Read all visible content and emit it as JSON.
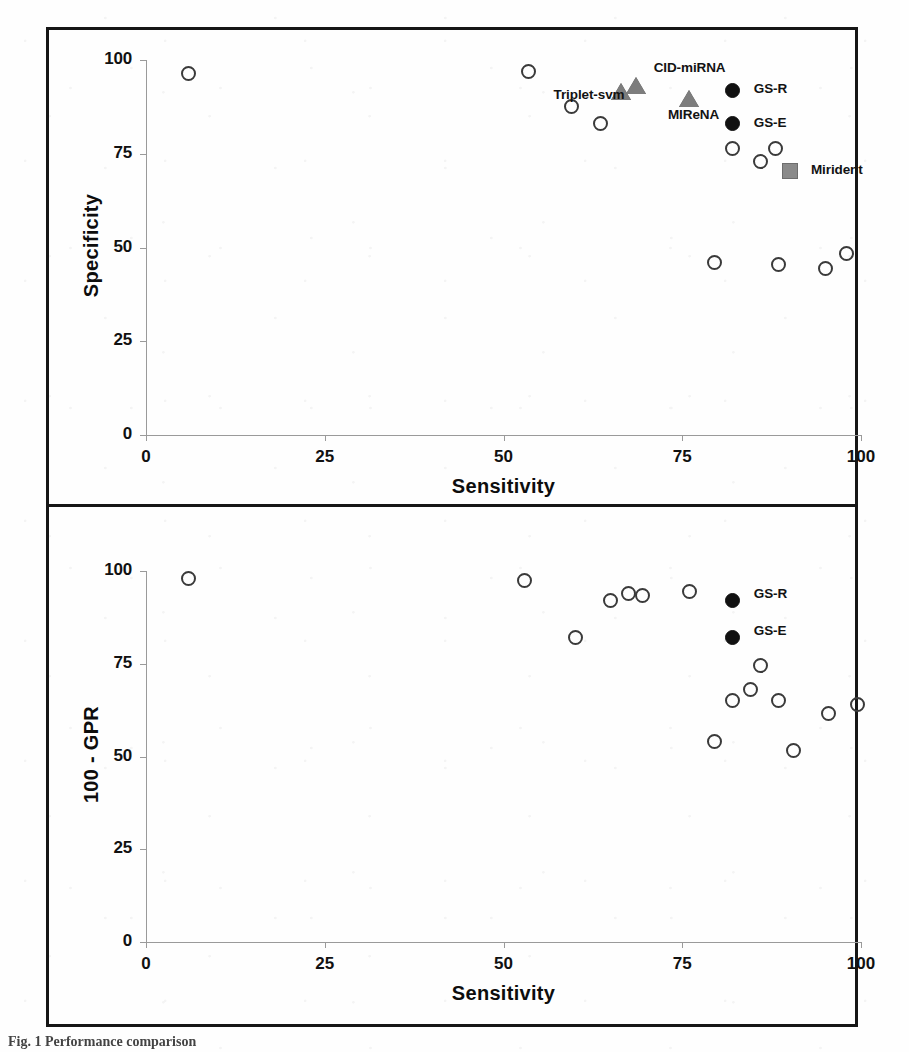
{
  "figure": {
    "caption": "Fig. 1 Performance comparison"
  },
  "chart_data": [
    {
      "type": "scatter",
      "panel": "top",
      "title": "",
      "xlabel": "Sensitivity",
      "ylabel": "Specificity",
      "xlim": [
        0,
        100
      ],
      "ylim": [
        0,
        100
      ],
      "xticks": [
        0,
        25,
        50,
        75,
        100
      ],
      "yticks": [
        0,
        25,
        50,
        75,
        100
      ],
      "grid": false,
      "legend": "none",
      "series": [
        {
          "name": "other-tools",
          "marker": "open-circle",
          "points": [
            {
              "x": 6.0,
              "y": 96.5
            },
            {
              "x": 53.5,
              "y": 97.0
            },
            {
              "x": 59.5,
              "y": 87.5
            },
            {
              "x": 63.5,
              "y": 83.0
            },
            {
              "x": 82.0,
              "y": 76.5
            },
            {
              "x": 88.0,
              "y": 76.5
            },
            {
              "x": 86.0,
              "y": 73.0
            },
            {
              "x": 79.5,
              "y": 46.0
            },
            {
              "x": 88.5,
              "y": 45.5
            },
            {
              "x": 95.0,
              "y": 44.5
            },
            {
              "x": 98.0,
              "y": 48.5
            }
          ]
        },
        {
          "name": "triangle-tools",
          "marker": "triangle",
          "points": [
            {
              "x": 66.5,
              "y": 91.5
            },
            {
              "x": 68.5,
              "y": 93.0
            },
            {
              "x": 76.0,
              "y": 89.5
            }
          ]
        },
        {
          "name": "gene-signature",
          "marker": "filled-circle",
          "points": [
            {
              "x": 82.0,
              "y": 92.0
            },
            {
              "x": 82.0,
              "y": 83.0
            }
          ]
        },
        {
          "name": "mirident",
          "marker": "square",
          "points": [
            {
              "x": 90.0,
              "y": 70.5
            }
          ]
        }
      ],
      "annotations": [
        {
          "text": "Triplet-svm",
          "x": 57.0,
          "y": 90.5
        },
        {
          "text": "CID-miRNA",
          "x": 71.0,
          "y": 97.5
        },
        {
          "text": "MIReNA",
          "x": 73.0,
          "y": 85.0
        },
        {
          "text": "GS-R",
          "x": 85.0,
          "y": 92.0
        },
        {
          "text": "GS-E",
          "x": 85.0,
          "y": 83.0
        },
        {
          "text": "Mirident",
          "x": 93.0,
          "y": 70.5
        }
      ]
    },
    {
      "type": "scatter",
      "panel": "bottom",
      "title": "",
      "xlabel": "Sensitivity",
      "ylabel": "100 - GPR",
      "xlim": [
        0,
        100
      ],
      "ylim": [
        0,
        100
      ],
      "xticks": [
        0,
        25,
        50,
        75,
        100
      ],
      "yticks": [
        0,
        25,
        50,
        75,
        100
      ],
      "grid": false,
      "legend": "none",
      "series": [
        {
          "name": "other-tools",
          "marker": "open-circle",
          "points": [
            {
              "x": 6.0,
              "y": 98.0
            },
            {
              "x": 53.0,
              "y": 97.5
            },
            {
              "x": 65.0,
              "y": 92.0
            },
            {
              "x": 67.5,
              "y": 94.0
            },
            {
              "x": 69.5,
              "y": 93.5
            },
            {
              "x": 60.0,
              "y": 82.0
            },
            {
              "x": 76.0,
              "y": 94.5
            },
            {
              "x": 86.0,
              "y": 74.5
            },
            {
              "x": 84.5,
              "y": 68.0
            },
            {
              "x": 82.0,
              "y": 65.0
            },
            {
              "x": 88.5,
              "y": 65.0
            },
            {
              "x": 79.5,
              "y": 54.0
            },
            {
              "x": 90.5,
              "y": 51.5
            },
            {
              "x": 95.5,
              "y": 61.5
            },
            {
              "x": 99.5,
              "y": 64.0
            }
          ]
        },
        {
          "name": "gene-signature",
          "marker": "filled-circle",
          "points": [
            {
              "x": 82.0,
              "y": 92.0
            },
            {
              "x": 82.0,
              "y": 82.0
            }
          ]
        }
      ],
      "annotations": [
        {
          "text": "GS-R",
          "x": 85.0,
          "y": 93.5
        },
        {
          "text": "GS-E",
          "x": 85.0,
          "y": 83.5
        }
      ]
    }
  ]
}
